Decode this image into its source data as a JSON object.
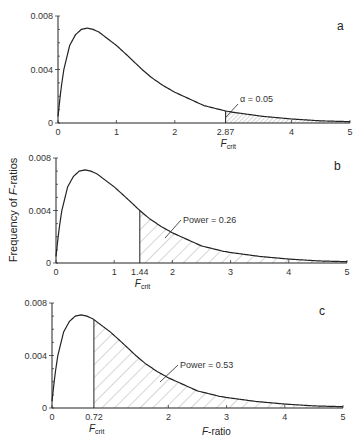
{
  "chart_data": {
    "type": "line",
    "title": "",
    "ylabel": "Frequency of F-ratios",
    "xlabel": "F-ratio",
    "curve": {
      "x": [
        0,
        0.05,
        0.1,
        0.2,
        0.3,
        0.4,
        0.5,
        0.6,
        0.7,
        0.85,
        1.0,
        1.2,
        1.44,
        1.6,
        1.8,
        2.0,
        2.25,
        2.5,
        2.87,
        3.0,
        3.5,
        4.0,
        4.5,
        5.0
      ],
      "y": [
        0.0005,
        0.0025,
        0.004,
        0.0058,
        0.0066,
        0.007,
        0.0071,
        0.007,
        0.0068,
        0.0063,
        0.0058,
        0.005,
        0.004,
        0.0034,
        0.0028,
        0.0023,
        0.0018,
        0.0013,
        0.0009,
        0.0008,
        0.0005,
        0.0003,
        0.00016,
        0.0001
      ]
    },
    "panels": [
      {
        "id": "a",
        "letter": "a",
        "f_crit": 2.87,
        "f_crit_label": "2.87",
        "shaded_label": "α = 0.05",
        "shaded_from": 2.87,
        "xlim": [
          0,
          5
        ],
        "ylim": [
          0,
          0.008
        ],
        "xticks": [
          0,
          1,
          2,
          4,
          5
        ],
        "yticks": [
          "0",
          "0.004",
          "0.008"
        ]
      },
      {
        "id": "b",
        "letter": "b",
        "f_crit": 1.44,
        "f_crit_label": "1.44",
        "shaded_label": "Power = 0.26",
        "shaded_from": 1.44,
        "xlim": [
          0,
          5
        ],
        "ylim": [
          0,
          0.008
        ],
        "xticks": [
          0,
          1,
          2,
          3,
          4,
          5
        ],
        "yticks": [
          "0",
          "0.004",
          "0.008"
        ]
      },
      {
        "id": "c",
        "letter": "c",
        "f_crit": 0.72,
        "f_crit_label": "0.72",
        "shaded_label": "Power = 0.53",
        "shaded_from": 0.72,
        "xlim": [
          0,
          5
        ],
        "ylim": [
          0,
          0.008
        ],
        "xticks": [
          0,
          2,
          3,
          4,
          5
        ],
        "yticks": [
          "0",
          "0.004",
          "0.008"
        ]
      }
    ],
    "f_crit_caption": "F",
    "f_crit_subscript": "crit",
    "grid": false,
    "legend": null
  },
  "labels": {
    "ylabel_prefix": "Frequency of ",
    "ylabel_italic": "F",
    "ylabel_suffix": "-ratios",
    "xlabel_italic": "F",
    "xlabel_suffix": "-ratio"
  }
}
